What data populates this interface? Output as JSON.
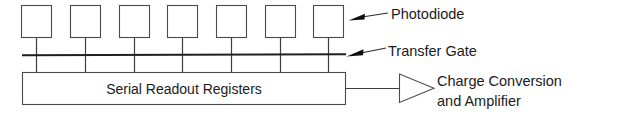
{
  "figure": {
    "background_color": "#ffffff",
    "line_color": "#4a4a4a",
    "text_color": "#1b1b1b"
  },
  "photodiode_array": {
    "count": 7,
    "element_name": "photodiode",
    "boxes": [
      {
        "index": 1
      },
      {
        "index": 2
      },
      {
        "index": 3
      },
      {
        "index": 4
      },
      {
        "index": 5
      },
      {
        "index": 6
      },
      {
        "index": 7
      }
    ]
  },
  "transfer_gate": {
    "element_name": "transfer-gate-bus"
  },
  "serial_register": {
    "label": "Serial Readout Registers"
  },
  "amplifier": {
    "symbol": "triangle-amplifier"
  },
  "annotations": [
    {
      "id": "photodiode",
      "label": "Photodiode",
      "lines": [
        "Photodiode"
      ]
    },
    {
      "id": "transfer-gate",
      "label": "Transfer Gate",
      "lines": [
        "Transfer Gate"
      ]
    },
    {
      "id": "charge-conversion",
      "label": "Charge Conversion and Amplifier",
      "lines": [
        "Charge Conversion",
        "and Amplifier"
      ]
    }
  ],
  "annotation_lines": {
    "photodiode_l1": "Photodiode",
    "transfer_gate_l1": "Transfer Gate",
    "charge_l1": "Charge Conversion",
    "charge_l2": "and Amplifier"
  }
}
